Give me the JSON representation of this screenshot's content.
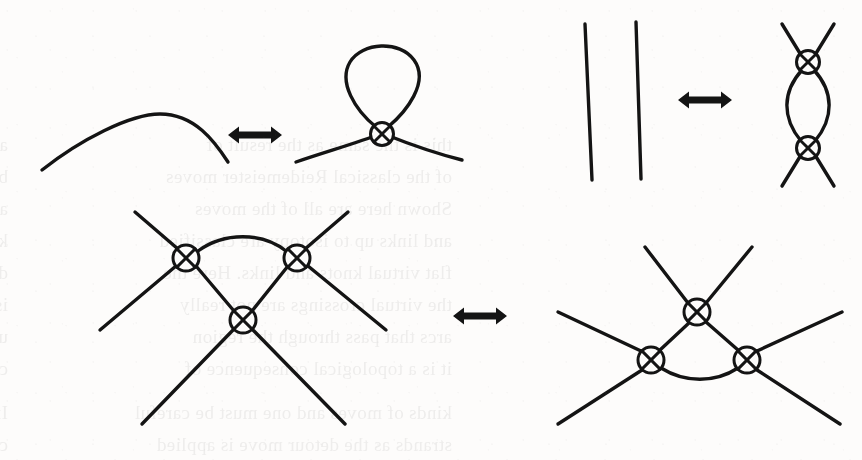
{
  "document": {
    "kind": "scanned-book-page-figure",
    "description": "Three virtual Reidemeister moves drawn with circled-X virtual crossings",
    "background_color": "#fdfcfb",
    "ink_color": "#141414",
    "width": 862,
    "height": 460
  },
  "ghost_text": {
    "note": "faint mirrored show-through text from the reverse side of the page",
    "color": "#4a4a4a",
    "opacity": 0.085,
    "lines": [
      {
        "x": 8,
        "y": 128,
        "text": "and there is the question of whether"
      },
      {
        "x": 8,
        "y": 160,
        "text": "by a sequence of moves in some sense"
      },
      {
        "x": 8,
        "y": 192,
        "text": "and classical knot theory in the plane"
      },
      {
        "x": 8,
        "y": 224,
        "text": "knots and links up to equivalence gives"
      },
      {
        "x": 8,
        "y": 256,
        "text": "diagram, generated by the moves shown"
      },
      {
        "x": 8,
        "y": 288,
        "text": "is a virtual crossing and no further"
      },
      {
        "x": 8,
        "y": 320,
        "text": "using the detour move so that one can"
      },
      {
        "x": 8,
        "y": 352,
        "text": "combinatorial structure of the diagram"
      },
      {
        "x": 8,
        "y": 396,
        "text": "In the virtual category there are two"
      },
      {
        "x": 8,
        "y": 428,
        "text": "classical crossings between the virtual"
      },
      {
        "x": 452,
        "y": 128,
        "text": "this is the same as the result of"
      },
      {
        "x": 452,
        "y": 160,
        "text": "of the classical Reidemeister moves"
      },
      {
        "x": 452,
        "y": 192,
        "text": "Shown here are all of the moves"
      },
      {
        "x": 452,
        "y": 224,
        "text": "and links up to isotopy are classified"
      },
      {
        "x": 452,
        "y": 256,
        "text": "flat virtual knots and links. Here the"
      },
      {
        "x": 452,
        "y": 288,
        "text": "the virtual crossings are not really"
      },
      {
        "x": 452,
        "y": 320,
        "text": "arcs that pass through the region"
      },
      {
        "x": 452,
        "y": 352,
        "text": "it is a topological consequence of"
      },
      {
        "x": 452,
        "y": 396,
        "text": "kinds of moves and one must be careful"
      },
      {
        "x": 452,
        "y": 428,
        "text": "strands as the detour move is applied"
      }
    ]
  },
  "figures": {
    "move_1": {
      "name": "virtual-reidemeister-move-one",
      "label": "R1",
      "left_side": {
        "name": "plain-arc",
        "crossings": [],
        "arc_path": "M 42 170 C 80 140, 130 114, 160 114 C 195 114, 215 142, 228 162"
      },
      "right_side": {
        "name": "arc-with-kink-loop",
        "crossings": [
          {
            "x": 382,
            "y": 134,
            "r": 11.5
          }
        ],
        "paths": [
          "M 296 162 C 325 152, 360 142, 380 134",
          "M 384 134 C 404 142, 438 154, 462 160",
          "M 376 127 C 355 110, 338 82, 350 62 C 362 42, 400 40, 414 60 C 430 82, 406 112, 388 127"
        ]
      },
      "arrow": {
        "name": "double-headed-arrow",
        "cx": 255,
        "cy": 135,
        "half_width": 27
      }
    },
    "move_2": {
      "name": "virtual-reidemeister-move-two",
      "label": "R2",
      "left_side": {
        "name": "two-parallel-strands",
        "crossings": [],
        "paths": [
          "M 585 24 L 592 180",
          "M 636 22 L 641 179"
        ]
      },
      "right_side": {
        "name": "bigon-with-two-crossings",
        "crossings": [
          {
            "x": 808,
            "y": 62,
            "r": 11.5
          },
          {
            "x": 808,
            "y": 148,
            "r": 11.5
          }
        ],
        "paths": [
          "M 782 24 L 801 55",
          "M 834 24 L 815 55",
          "M 782 186 L 801 155",
          "M 834 186 L 815 155",
          "M 802 70 C 782 92, 782 118, 801 141",
          "M 814 70 C 834 92, 834 118, 815 141"
        ]
      },
      "arrow": {
        "name": "double-headed-arrow",
        "cx": 705,
        "cy": 100,
        "half_width": 27
      }
    },
    "move_3": {
      "name": "virtual-reidemeister-move-three",
      "label": "R3",
      "left_side": {
        "name": "triangle-arc-above",
        "crossings": [
          {
            "x": 186,
            "y": 258,
            "r": 13
          },
          {
            "x": 297,
            "y": 258,
            "r": 13
          },
          {
            "x": 243,
            "y": 320,
            "r": 13
          }
        ],
        "paths": [
          "M 135 212 L 178 249",
          "M 348 212 L 305 249",
          "M 196 266 L 234 311",
          "M 288 266 L 252 311",
          "M 198 251 C 224 232, 262 232, 286 251",
          "M 176 266 L 100 330",
          "M 308 266 L 386 330",
          "M 234 329 L 142 424",
          "M 252 329 L 345 424"
        ]
      },
      "right_side": {
        "name": "triangle-arc-below",
        "crossings": [
          {
            "x": 697,
            "y": 312,
            "r": 13
          },
          {
            "x": 651,
            "y": 360,
            "r": 13
          },
          {
            "x": 747,
            "y": 360,
            "r": 13
          }
        ],
        "paths": [
          "M 645 247 L 688 303",
          "M 752 247 L 706 303",
          "M 690 322 L 660 350",
          "M 706 322 L 738 350",
          "M 661 368 C 685 383, 715 383, 738 368",
          "M 641 351 L 558 312",
          "M 757 351 L 842 312",
          "M 642 370 L 558 424",
          "M 757 370 L 840 424"
        ]
      },
      "arrow": {
        "name": "double-headed-arrow",
        "cx": 480,
        "cy": 316,
        "half_width": 27
      }
    }
  }
}
